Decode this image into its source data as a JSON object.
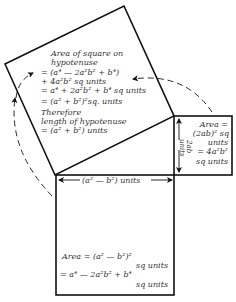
{
  "diagram": {
    "colors": {
      "line": "#111111",
      "text": "#333333",
      "background": "#ffffff"
    },
    "hypotenuse_square": {
      "lines": [
        "Area of square on",
        "hypotenuse",
        "= (a⁴ — 2a²b² + b⁴)",
        "+ 4a²b² sq units",
        "= a⁴ + 2a²b² + b⁴ sq units",
        "= (a² + b²)²sq. units",
        "Therefore",
        "length of hypotenuse",
        "= (a² + b²) units"
      ]
    },
    "small_square": {
      "side_label_line1": "2ab",
      "side_label_line2": "units",
      "lines": [
        "Area =",
        "(2ab)² sq",
        "units",
        "= 4a²b²",
        "sq units"
      ]
    },
    "bottom_square": {
      "side_label": "(a² — b²) units",
      "lines": [
        "Area = (a² — b²)²",
        "sq units",
        "= a⁴ — 2a²b² + b⁴",
        "sq units"
      ]
    }
  }
}
